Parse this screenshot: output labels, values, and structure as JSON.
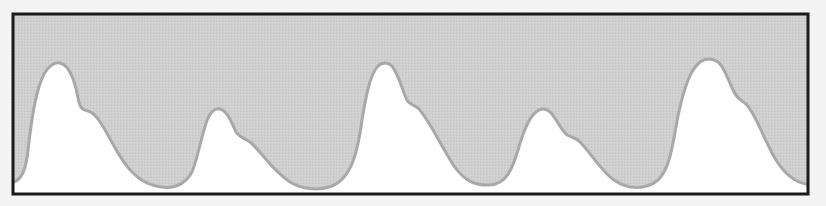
{
  "figure": {
    "colors": {
      "page_background": "#f4f4f4",
      "upper_fill": "#cfcfcf",
      "lower_fill": "#ffffff",
      "curve_stroke": "#a8a8a8",
      "frame": "#1a1a1a"
    },
    "frame": {
      "x": 13,
      "y": 14,
      "width": 795,
      "height": 180,
      "stroke_width": 3
    },
    "curve_path": "M14,182 C20,180 26,172 28,150 C32,115 36,90 44,74 C50,64 56,62 60,63 C68,65 74,76 78,98 C80,108 82,110 88,111 C96,113 102,124 114,146 C126,168 138,182 156,186 C172,190 184,186 192,172 C198,158 202,132 208,118 C212,110 216,108 220,109 C228,111 232,124 236,132 C240,138 244,138 250,142 C260,150 272,170 290,182 C300,188 316,192 332,186 C352,178 358,150 362,120 C366,96 370,74 378,66 C382,62 388,62 392,66 C398,74 402,88 406,98 C408,104 412,104 418,108 C428,118 440,144 454,166 C464,180 474,186 490,185 C506,184 512,170 518,150 C522,136 528,118 536,112 C540,108 546,108 550,112 C556,118 560,128 566,134 C570,138 574,136 580,142 C590,152 602,172 614,180 C628,190 646,190 658,180 C670,168 672,148 678,116 C684,88 690,70 700,62 C706,58 712,58 718,62 C724,66 728,80 734,92 C738,100 742,100 746,104 C756,114 764,140 776,160 C786,176 796,182 806,184",
    "peaks": [
      {
        "label": "peak-1",
        "x": 58,
        "y": 63
      },
      {
        "label": "peak-2",
        "x": 216,
        "y": 109
      },
      {
        "label": "peak-3",
        "x": 385,
        "y": 63
      },
      {
        "label": "peak-4",
        "x": 543,
        "y": 109
      },
      {
        "label": "peak-5",
        "x": 713,
        "y": 59
      }
    ]
  }
}
